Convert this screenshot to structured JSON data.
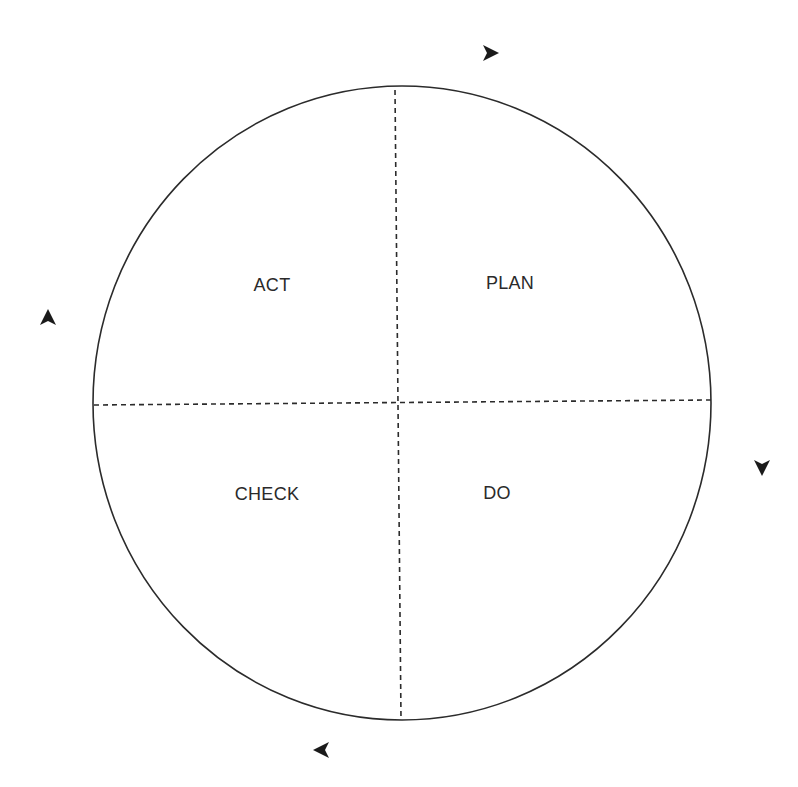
{
  "diagram": {
    "type": "PDCA cycle",
    "caption_clipped": "",
    "quadrants": [
      {
        "id": "act",
        "label": "ACT",
        "x": 272,
        "y": 285
      },
      {
        "id": "plan",
        "label": "PLAN",
        "x": 510,
        "y": 283
      },
      {
        "id": "check",
        "label": "CHECK",
        "x": 267,
        "y": 494
      },
      {
        "id": "do",
        "label": "DO",
        "x": 497,
        "y": 493
      }
    ],
    "arrows": [
      {
        "id": "arrow-top",
        "direction": "right",
        "x": 490,
        "y": 53
      },
      {
        "id": "arrow-right",
        "direction": "down",
        "x": 762,
        "y": 467
      },
      {
        "id": "arrow-bottom",
        "direction": "left",
        "x": 322,
        "y": 750
      },
      {
        "id": "arrow-left",
        "direction": "up",
        "x": 48,
        "y": 318
      }
    ],
    "colors": {
      "stroke": "#2b2b2b",
      "background": "#ffffff"
    }
  }
}
